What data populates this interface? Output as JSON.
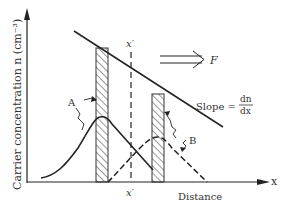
{
  "diagram": {
    "type": "carrier-diffusion",
    "y_axis_label": "Carrier concentration n (cm⁻³)",
    "x_axis_label": "Distance",
    "x_axis_symbol": "x",
    "x_prime_top": "x′",
    "x_prime_bottom": "x′",
    "flux_label": "F",
    "slope_label": "Slope =",
    "slope_num": "dn",
    "slope_den": "dx",
    "curve_a_label": "A",
    "curve_b_label": "B",
    "colors": {
      "ink": "#222222",
      "text": "#333333",
      "background": "#ffffff"
    }
  }
}
